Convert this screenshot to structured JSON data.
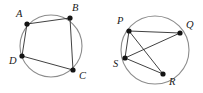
{
  "figure": {
    "background_color": "#ffffff",
    "circle_stroke_color": "#8c8c8c",
    "chord_stroke_color": "#2b2b2b",
    "vertex_color": "#141414",
    "label_color": "#1a1a1a"
  },
  "diagrams": [
    {
      "id": "left-circle",
      "name": "circle-abcd",
      "circle": {
        "cx": 51,
        "cy": 46,
        "r": 31
      },
      "vertices": [
        {
          "label": "A",
          "x": 27,
          "y": 24,
          "label_x": 16,
          "label_y": 15
        },
        {
          "label": "B",
          "x": 70,
          "y": 18,
          "label_x": 72,
          "label_y": 9
        },
        {
          "label": "C",
          "x": 73,
          "y": 70,
          "label_x": 79,
          "label_y": 77
        },
        {
          "label": "D",
          "x": 22,
          "y": 56,
          "label_x": 9,
          "label_y": 62
        }
      ],
      "segments": [
        {
          "from": "A",
          "to": "B"
        },
        {
          "from": "B",
          "to": "C"
        },
        {
          "from": "D",
          "to": "C"
        },
        {
          "from": "A",
          "to": "D"
        }
      ]
    },
    {
      "id": "right-circle",
      "name": "circle-pqrs",
      "circle": {
        "cx": 155,
        "cy": 50,
        "r": 34
      },
      "vertices": [
        {
          "label": "P",
          "x": 129,
          "y": 31,
          "label_x": 117,
          "label_y": 22
        },
        {
          "label": "Q",
          "x": 180,
          "y": 33,
          "label_x": 186,
          "label_y": 26
        },
        {
          "label": "R",
          "x": 163,
          "y": 74,
          "label_x": 169,
          "label_y": 83
        },
        {
          "label": "S",
          "x": 125,
          "y": 58,
          "label_x": 113,
          "label_y": 65
        }
      ],
      "segments": [
        {
          "from": "P",
          "to": "Q"
        },
        {
          "from": "P",
          "to": "R"
        },
        {
          "from": "P",
          "to": "S"
        },
        {
          "from": "S",
          "to": "Q"
        },
        {
          "from": "S",
          "to": "R"
        }
      ]
    }
  ]
}
